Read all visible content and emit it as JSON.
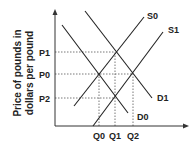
{
  "chart_data": {
    "type": "line",
    "title": "",
    "xlabel": "",
    "ylabel": "Price of pounds in dollars per pound",
    "ylabel_lines": [
      "Price of pounds in",
      "dollars per pound"
    ],
    "grid": false,
    "y_ticks": [
      {
        "label": "P1",
        "y": 52
      },
      {
        "label": "P0",
        "y": 74
      },
      {
        "label": "P2",
        "y": 98
      }
    ],
    "x_ticks": [
      {
        "label": "Q0",
        "x": 99
      },
      {
        "label": "Q1",
        "x": 115
      },
      {
        "label": "Q2",
        "x": 133
      }
    ],
    "series": [
      {
        "name": "S0",
        "type": "supply",
        "points": [
          [
            74,
            106
          ],
          [
            144,
            17
          ]
        ],
        "label_pos": [
          147,
          19
        ]
      },
      {
        "name": "S1",
        "type": "supply",
        "points": [
          [
            93,
            126
          ],
          [
            163,
            32
          ]
        ],
        "label_pos": [
          168,
          33
        ]
      },
      {
        "name": "D0",
        "type": "demand",
        "points": [
          [
            62,
            25
          ],
          [
            128,
            113
          ]
        ],
        "label_pos": [
          137,
          120
        ]
      },
      {
        "name": "D1",
        "type": "demand",
        "points": [
          [
            85,
            11
          ],
          [
            152,
            98
          ]
        ],
        "label_pos": [
          157,
          101
        ]
      }
    ],
    "equilibria": [
      {
        "price": "P0",
        "quantity": "Q0",
        "curves": [
          "S0",
          "D0"
        ]
      },
      {
        "price": "P1",
        "quantity": "Q1",
        "curves": [
          "S0",
          "D1"
        ]
      },
      {
        "price": "P2",
        "quantity": "Q1",
        "curves": [
          "S1",
          "D0"
        ]
      },
      {
        "price": "P0",
        "quantity": "Q2",
        "curves": [
          "S1",
          "D1"
        ]
      }
    ]
  },
  "colors": {
    "line": "#222222",
    "dashed": "#555555"
  }
}
